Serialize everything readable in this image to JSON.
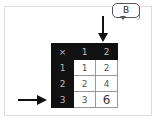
{
  "bubble": {
    "label": "B"
  },
  "table": {
    "corner": "×",
    "column_headers": [
      "1",
      "2"
    ],
    "rows": [
      {
        "header": "1",
        "cells": [
          "1",
          "2"
        ]
      },
      {
        "header": "2",
        "cells": [
          "2",
          "4"
        ]
      },
      {
        "header": "3",
        "cells": [
          "3",
          "6"
        ]
      }
    ]
  },
  "arrows": {
    "down": {
      "points_to": "column 2"
    },
    "right": {
      "points_to": "row 3"
    }
  },
  "colors": {
    "header_bg": "#111111",
    "header_text": "#bbbbbb",
    "cell_border": "#999999",
    "frame_border": "#dcdcdc"
  }
}
